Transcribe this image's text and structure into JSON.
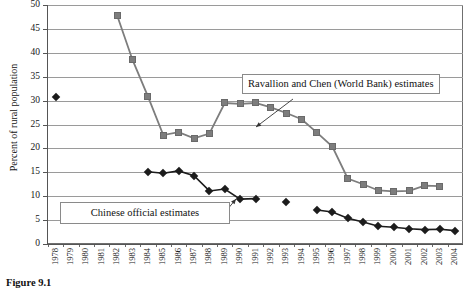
{
  "figure": {
    "caption": "Figure 9.1"
  },
  "chart_data": {
    "type": "line",
    "title": "",
    "xlabel": "",
    "ylabel": "Percent of rural population",
    "ylim": [
      0,
      50
    ],
    "ytick_step": 5,
    "yticks": [
      "0",
      "5",
      "10",
      "15",
      "20",
      "25",
      "30",
      "35",
      "40",
      "45",
      "50"
    ],
    "grid": true,
    "legend_position": "inline-callouts",
    "categories": [
      "1978",
      "1979",
      "1980",
      "1981",
      "1982",
      "1983",
      "1984",
      "1985",
      "1986",
      "1987",
      "1988",
      "1989",
      "1990",
      "1991",
      "1992",
      "1993",
      "1994",
      "1995",
      "1996",
      "1997",
      "1998",
      "1999",
      "2000",
      "2001",
      "2002",
      "2003",
      "2004"
    ],
    "series": [
      {
        "name": "Ravallion and Chen (World Bank) estimates",
        "marker": "square",
        "color": "#7d7d7d",
        "values": [
          null,
          null,
          null,
          null,
          47.8,
          38.5,
          30.9,
          22.8,
          23.4,
          22.1,
          23.1,
          29.5,
          29.3,
          29.5,
          28.6,
          27.4,
          26.1,
          23.3,
          20.4,
          13.7,
          12.5,
          11.2,
          11.0,
          11.1,
          12.2,
          12.1,
          null
        ]
      },
      {
        "name": "Chinese official estimates",
        "marker": "diamond",
        "color": "#1c1c1c",
        "values": [
          30.7,
          null,
          null,
          null,
          null,
          null,
          15.1,
          14.8,
          15.3,
          14.3,
          11.1,
          11.5,
          9.4,
          9.5,
          null,
          8.8,
          null,
          7.1,
          6.7,
          5.4,
          4.6,
          3.7,
          3.5,
          3.2,
          3.0,
          3.1,
          2.8
        ]
      }
    ],
    "annotations": [
      {
        "id": "callout-worldbank",
        "text": "Ravallion and Chen (World Bank) estimates",
        "arrow_from": [
          293,
          99
        ],
        "arrow_to": [
          256,
          127
        ]
      },
      {
        "id": "callout-official",
        "text": "Chinese official estimates",
        "arrow_from": [
          222,
          216
        ],
        "arrow_to": [
          236,
          199
        ]
      }
    ]
  }
}
